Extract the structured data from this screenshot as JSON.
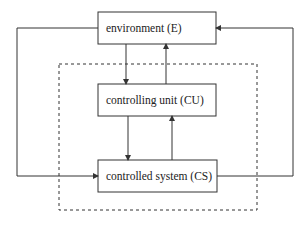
{
  "diagram": {
    "boxes": {
      "environment": {
        "label": "environment (E)"
      },
      "controlling_unit": {
        "label": "controlling unit (CU)"
      },
      "controlled_system": {
        "label": "controlled system (CS)"
      }
    },
    "colors": {
      "stroke": "#333333",
      "background": "#ffffff"
    }
  }
}
